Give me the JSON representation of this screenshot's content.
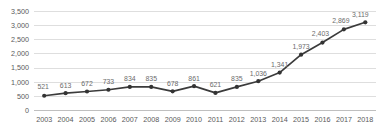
{
  "chart_data": {
    "type": "line",
    "title": "",
    "subtitle": "",
    "xlabel": "",
    "ylabel": "",
    "categories": [
      "2003",
      "2004",
      "2005",
      "2006",
      "2007",
      "2008",
      "2009",
      "2010",
      "2011",
      "2012",
      "2013",
      "2014",
      "2015",
      "2016",
      "2017",
      "2018"
    ],
    "values": [
      521,
      613,
      672,
      733,
      834,
      835,
      678,
      861,
      621,
      835,
      1036,
      1341,
      1973,
      2403,
      2869,
      3119
    ],
    "data_labels": [
      "521",
      "613",
      "672",
      "733",
      "834",
      "835",
      "678",
      "861",
      "621",
      "835",
      "1,036",
      "1,341",
      "1,973",
      "2,403",
      "2,869",
      "3,119"
    ],
    "series": [
      {
        "name": "",
        "values": [
          521,
          613,
          672,
          733,
          834,
          835,
          678,
          861,
          621,
          835,
          1036,
          1341,
          1973,
          2403,
          2869,
          3119
        ]
      }
    ],
    "ylim": [
      0,
      3500
    ],
    "ytick_values": [
      0,
      500,
      1000,
      1500,
      2000,
      2500,
      3000,
      3500
    ],
    "ytick_labels": [
      "0",
      "500",
      "1,000",
      "1,500",
      "2,000",
      "2,500",
      "3,000",
      "3,500"
    ],
    "grid": "horizontal",
    "legend": "none",
    "legend_position": "",
    "annotations": [],
    "marker": "circle",
    "colors": {
      "line": "#3b3b3b",
      "marker": "#333333",
      "gridline": "#d6d6d6",
      "axis": "#b8b8b8",
      "tick_label": "#5a5a5a",
      "data_label": "#6b6b6b",
      "background": "#ffffff"
    }
  }
}
